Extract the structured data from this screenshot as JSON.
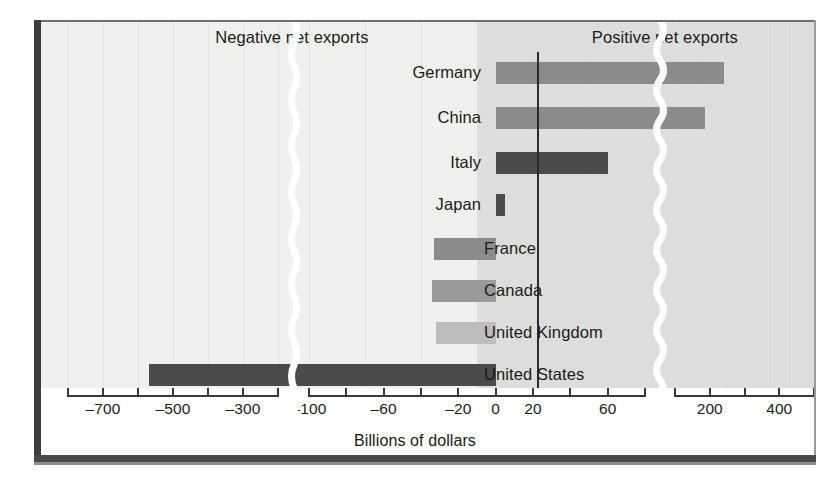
{
  "chart_data": {
    "type": "bar",
    "orientation": "horizontal",
    "title": "",
    "xlabel": "Billions of dollars",
    "ylabel": "",
    "categories": [
      "Germany",
      "China",
      "Italy",
      "Japan",
      "France",
      "Canada",
      "United Kingdom",
      "United States"
    ],
    "values": [
      240,
      185,
      60,
      5,
      -33,
      -34,
      -32,
      -570
    ],
    "series": [
      {
        "name": "Net exports",
        "values": [
          240,
          185,
          60,
          5,
          -33,
          -34,
          -32,
          -570
        ]
      }
    ],
    "bar_colors": [
      "#8c8c8c",
      "#8c8c8c",
      "#4b4b4b",
      "#4b4b4b",
      "#8c8c8c",
      "#9a9a9a",
      "#bdbdbd",
      "#4b4b4b"
    ],
    "axis_broken": true,
    "axis_segments": [
      {
        "min": -800,
        "max": -200,
        "tick_step": 100
      },
      {
        "min": -100,
        "max": 80,
        "tick_step": 20
      },
      {
        "min": 100,
        "max": 500,
        "tick_step": 100
      }
    ],
    "tick_labels": [
      "-700",
      "-500",
      "-300",
      "-100",
      "-60",
      "-20",
      "0",
      "20",
      "60",
      "200",
      "400"
    ],
    "tick_values": [
      -700,
      -500,
      -300,
      -100,
      -60,
      -20,
      0,
      20,
      60,
      200,
      400
    ],
    "grid": true,
    "legend": "none",
    "annotations": [
      "Negative net exports",
      "Positive net exports"
    ]
  },
  "regions": {
    "negative_label": "Negative net exports",
    "positive_label": "Positive net exports"
  },
  "axis": {
    "title": "Billions of dollars",
    "ticks": [
      {
        "label": "-700"
      },
      {
        "label": "-500"
      },
      {
        "label": "-300"
      },
      {
        "label": "-100"
      },
      {
        "label": "-60"
      },
      {
        "label": "-20"
      },
      {
        "label": "0"
      },
      {
        "label": "20"
      },
      {
        "label": "60"
      },
      {
        "label": "200"
      },
      {
        "label": "400"
      }
    ]
  },
  "bars": [
    {
      "country": "Germany",
      "value": 240
    },
    {
      "country": "China",
      "value": 185
    },
    {
      "country": "Italy",
      "value": 60
    },
    {
      "country": "Japan",
      "value": 5
    },
    {
      "country": "France",
      "value": -33
    },
    {
      "country": "Canada",
      "value": -34
    },
    {
      "country": "United Kingdom",
      "value": -32
    },
    {
      "country": "United States",
      "value": -570
    }
  ],
  "colors": {
    "panel_negative_bg": "#f0f0ee",
    "panel_positive_bg": "#dddddb",
    "bar_light": "#bdbdbd",
    "bar_medium": "#9a9a9a",
    "bar_gray": "#8c8c8c",
    "bar_dark": "#4b4b4b",
    "frame": "#3d3d3d",
    "break_line": "#ffffff"
  }
}
